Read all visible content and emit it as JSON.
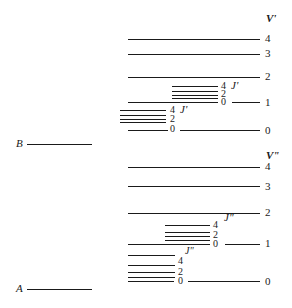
{
  "diagram": {
    "type": "energy-level-diagram",
    "upper_state": {
      "label": "B",
      "vib_axis_label": "V'",
      "rot_label": "J'",
      "vib_levels": [
        {
          "v": "4",
          "y": 39
        },
        {
          "v": "3",
          "y": 54
        },
        {
          "v": "2",
          "y": 77
        },
        {
          "v": "1",
          "y": 103
        },
        {
          "v": "0",
          "y": 130
        }
      ],
      "rot_groups": [
        {
          "vib": "1",
          "labels": [
            "4",
            "2",
            "0"
          ],
          "rot_label": "J'"
        },
        {
          "vib": "0",
          "labels": [
            "4",
            "2",
            "0"
          ],
          "rot_label": "J'"
        }
      ]
    },
    "lower_state": {
      "label": "A",
      "vib_axis_label": "V\"",
      "rot_label": "J\"",
      "vib_levels": [
        {
          "v": "4",
          "y": 167
        },
        {
          "v": "3",
          "y": 186
        },
        {
          "v": "2",
          "y": 213
        },
        {
          "v": "1",
          "y": 244
        },
        {
          "v": "0",
          "y": 281
        }
      ],
      "rot_groups": [
        {
          "vib": "1",
          "labels": [
            "4",
            "2",
            "0"
          ],
          "rot_label": "J\""
        },
        {
          "vib": "0",
          "labels": [
            "4",
            "2",
            "0"
          ],
          "rot_label": "J\""
        }
      ]
    }
  }
}
